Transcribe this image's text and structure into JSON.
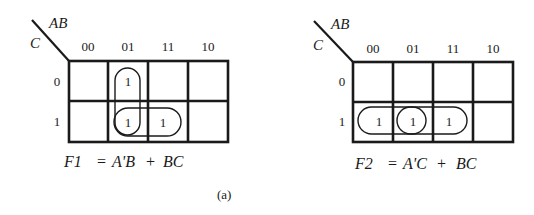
{
  "figure": {
    "caption": "(a)",
    "maps": [
      {
        "id": "F1",
        "row_var": "C",
        "col_var": "AB",
        "col_labels": [
          "00",
          "01",
          "11",
          "10"
        ],
        "row_labels": [
          "0",
          "1"
        ],
        "cells": [
          [
            "",
            "1",
            "",
            ""
          ],
          [
            "",
            "1",
            "1",
            ""
          ]
        ],
        "groups": [
          {
            "term": "A'B",
            "cells": [
              [
                0,
                1
              ],
              [
                1,
                1
              ]
            ]
          },
          {
            "term": "BC",
            "cells": [
              [
                1,
                1
              ],
              [
                1,
                2
              ]
            ]
          }
        ],
        "equation": {
          "lhs": "F1",
          "eq": "=",
          "term1": "A'B",
          "plus": "+",
          "term2": "BC"
        }
      },
      {
        "id": "F2",
        "row_var": "C",
        "col_var": "AB",
        "col_labels": [
          "00",
          "01",
          "11",
          "10"
        ],
        "row_labels": [
          "0",
          "1"
        ],
        "cells": [
          [
            "",
            "",
            "",
            ""
          ],
          [
            "1",
            "1",
            "1",
            ""
          ]
        ],
        "groups": [
          {
            "term": "A'C",
            "cells": [
              [
                1,
                0
              ],
              [
                1,
                1
              ]
            ]
          },
          {
            "term": "BC",
            "cells": [
              [
                1,
                1
              ],
              [
                1,
                2
              ]
            ]
          }
        ],
        "equation": {
          "lhs": "F2",
          "eq": "=",
          "term1": "A'C",
          "plus": "+",
          "term2": "BC"
        }
      }
    ]
  }
}
